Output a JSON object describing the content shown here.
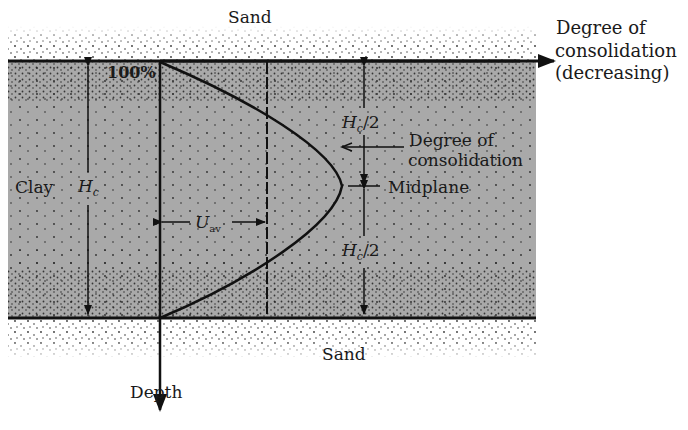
{
  "diagram": {
    "layers": {
      "top": "Sand",
      "middle": "Clay",
      "bottom": "Sand"
    },
    "labels": {
      "sand_top": "Sand",
      "sand_bottom": "Sand",
      "clay": "Clay",
      "hc_main": "H",
      "hc_main_sub": "c",
      "hc_half_top": "H",
      "hc_half_top_sub": "c",
      "hc_half_top_tail": "/2",
      "hc_half_bottom": "H",
      "hc_half_bottom_sub": "c",
      "hc_half_bottom_tail": "/2",
      "percent_100": "100%",
      "uav": "U",
      "uav_sub": "av",
      "degree_curve_line1": "Degree of",
      "degree_curve_line2": "consolidation",
      "midplane": "Midplane",
      "x_axis_line1": "Degree of",
      "x_axis_line2": "consolidation",
      "x_axis_line3": "(decreasing)",
      "y_axis": "Depth"
    },
    "colors": {
      "clay_fill": "#a9a9a9",
      "line": "#111111",
      "background": "#ffffff"
    }
  }
}
